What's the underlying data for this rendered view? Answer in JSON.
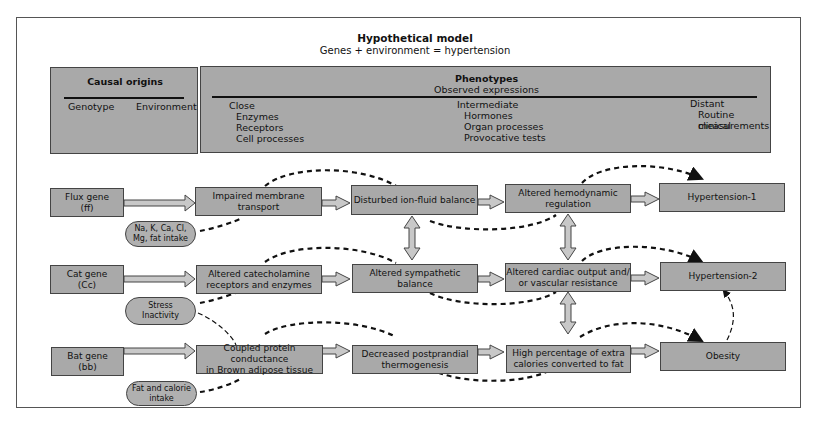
{
  "header": {
    "title": "Hypothetical model",
    "subtitle": "Genes + environment = hypertension"
  },
  "causal_origins": {
    "title": "Causal origins",
    "columns": [
      "Genotype",
      "Environment"
    ]
  },
  "phenotypes": {
    "title": "Phenotypes",
    "subtitle": "Observed expressions",
    "groups": [
      {
        "label": "Close",
        "items": [
          "Enzymes",
          "Receptors",
          "Cell processes"
        ]
      },
      {
        "label": "Intermediate",
        "items": [
          "Hormones",
          "Organ processes",
          "Provocative tests"
        ]
      },
      {
        "label": "Distant",
        "items": [
          "Routine clinical",
          "measurements"
        ]
      }
    ]
  },
  "rows": [
    {
      "gene": "Flux gene\n(ff)",
      "environment": "Na, K, Ca, Cl,\nMg, fat intake",
      "close": "Impaired membrane\ntransport",
      "intermediate_1": "Disturbed ion-fluid balance",
      "intermediate_2": "Altered hemodynamic\nregulation",
      "outcome": "Hypertension-1"
    },
    {
      "gene": "Cat gene\n(Cc)",
      "environment": "Stress\nInactivity",
      "close": "Altered catecholamine\nreceptors and enzymes",
      "intermediate_1": "Altered sympathetic\nbalance",
      "intermediate_2": "Altered cardiac output and/\nor vascular resistance",
      "outcome": "Hypertension-2"
    },
    {
      "gene": "Bat gene\n(bb)",
      "environment": "Fat and calorie\nintake",
      "close": "Coupled protein conductance\nin Brown adipose tissue",
      "intermediate_1": "Decreased postprandial\nthermogenesis",
      "intermediate_2": "High percentage of extra\ncalories converted to fat",
      "outcome": "Obesity"
    }
  ],
  "colors": {
    "box_fill": "#a9a9a9",
    "border": "#444444",
    "arrow_fill": "#c8c8c8",
    "dashed": "#111111"
  }
}
